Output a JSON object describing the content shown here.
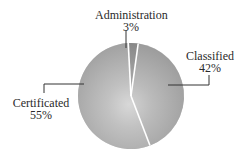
{
  "chart_data": {
    "type": "pie",
    "title": "",
    "categories": [
      "Administration",
      "Classified",
      "Certificated"
    ],
    "values": [
      3,
      42,
      55
    ],
    "units": "%",
    "labels": [
      {
        "name": "Administration",
        "value_label": "3%"
      },
      {
        "name": "Classified",
        "value_label": "42%"
      },
      {
        "name": "Certificated",
        "value_label": "55%"
      }
    ],
    "colors": {
      "Administration": "#6f6f6f",
      "Classified": "#9a9a9a",
      "Certificated": "#a8a8a8",
      "highlight": "#ffffff",
      "separator": "#ffffff",
      "leader_line": "#333333"
    },
    "legend": "none (direct labels with leader lines)"
  }
}
